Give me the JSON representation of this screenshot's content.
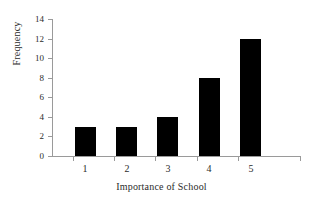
{
  "chart_data": {
    "type": "bar",
    "title": "",
    "categories": [
      "1",
      "2",
      "3",
      "4",
      "5"
    ],
    "values": [
      3,
      3,
      4,
      8,
      12
    ],
    "series": [
      {
        "name": "Frequency",
        "values": [
          3,
          3,
          4,
          8,
          12
        ]
      }
    ],
    "xlabel": "Importance of School",
    "ylabel": "Frequency",
    "ylim": [
      0,
      14
    ],
    "yticks": [
      0,
      2,
      4,
      6,
      8,
      10,
      12,
      14
    ],
    "ytick_labels": [
      "0",
      "2",
      "4",
      "6",
      "8",
      "10",
      "12",
      "14"
    ],
    "xtick_labels": [
      "1",
      "2",
      "3",
      "4",
      "5"
    ],
    "grid": false,
    "legend": false,
    "legend_position": "none",
    "bar_color": "#000000",
    "axis_color": "#9a9a9a",
    "background_color": "#ffffff"
  }
}
